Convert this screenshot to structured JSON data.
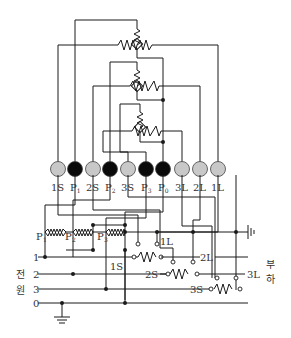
{
  "diagram": {
    "terminal_colors": {
      "current": "#c8c8c8",
      "voltage": "#0a0a0a"
    },
    "terminals": [
      {
        "label": "1S",
        "type": "current"
      },
      {
        "label": "P1",
        "type": "voltage"
      },
      {
        "label": "2S",
        "type": "current"
      },
      {
        "label": "P2",
        "type": "voltage"
      },
      {
        "label": "3S",
        "type": "current"
      },
      {
        "label": "P3",
        "type": "voltage"
      },
      {
        "label": "P0",
        "type": "voltage"
      },
      {
        "label": "3L",
        "type": "current"
      },
      {
        "label": "2L",
        "type": "current"
      },
      {
        "label": "1L",
        "type": "current"
      }
    ],
    "source_lines": [
      "1",
      "2",
      "3",
      "0"
    ],
    "source_label_1": "전",
    "source_label_2": "원",
    "load_label_1": "부",
    "load_label_2": "하",
    "pt_labels": [
      "P",
      "P",
      "P"
    ],
    "pt_subs": [
      "1",
      "2",
      "3"
    ],
    "ct_labels": {
      "s1": "1S",
      "l1": "1L",
      "s2": "2S",
      "l2": "2L",
      "s3": "3S",
      "l3": "3L"
    }
  }
}
